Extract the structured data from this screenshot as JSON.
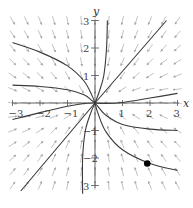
{
  "figure": {
    "type": "phase-portrait"
  },
  "axes": {
    "x_label": "x",
    "y_label": "y",
    "x_range": [
      -3,
      3
    ],
    "y_range": [
      -3,
      3
    ],
    "x_ticks": [
      {
        "value": -3,
        "label": "−3"
      },
      {
        "value": -2,
        "label": "−2"
      },
      {
        "value": -1,
        "label": "−1"
      },
      {
        "value": 1,
        "label": "1"
      },
      {
        "value": 2,
        "label": "2"
      },
      {
        "value": 3,
        "label": "3"
      }
    ],
    "y_ticks": [
      {
        "value": 3,
        "label": "3"
      },
      {
        "value": 2,
        "label": "2"
      },
      {
        "value": 1,
        "label": "1"
      },
      {
        "value": -1,
        "label": "−1"
      },
      {
        "value": -2,
        "label": "−2"
      },
      {
        "value": -3,
        "label": "3"
      }
    ]
  },
  "vector_field": {
    "grid_min": -3,
    "grid_max": 3,
    "grid_step": 0.5,
    "arrow_color": "#a8a8a8"
  },
  "solution_curves": {
    "color": "#3a3a3a",
    "curves": [
      {
        "name": "upper-left-high",
        "points": [
          [
            -3,
            2.2
          ],
          [
            -2,
            1.85
          ],
          [
            -1,
            1.35
          ],
          [
            -0.4,
            0.8
          ],
          [
            -0.1,
            0.25
          ],
          [
            0,
            0
          ]
        ]
      },
      {
        "name": "upper-left-low",
        "points": [
          [
            -3,
            0.65
          ],
          [
            -2,
            0.6
          ],
          [
            -1,
            0.48
          ],
          [
            -0.4,
            0.3
          ],
          [
            -0.1,
            0.08
          ],
          [
            0,
            0
          ]
        ]
      },
      {
        "name": "top",
        "points": [
          [
            0.45,
            3
          ],
          [
            0.42,
            2
          ],
          [
            0.32,
            1
          ],
          [
            0.15,
            0.4
          ],
          [
            0,
            0
          ]
        ]
      },
      {
        "name": "upper-right-line",
        "points": [
          [
            2.6,
            3
          ],
          [
            0,
            0
          ]
        ]
      },
      {
        "name": "right-upper",
        "points": [
          [
            3,
            0.35
          ],
          [
            2,
            0.18
          ],
          [
            1,
            0.02
          ],
          [
            0.4,
            -0.02
          ],
          [
            0,
            0
          ]
        ]
      },
      {
        "name": "left-lower",
        "points": [
          [
            -3,
            -0.6
          ],
          [
            -2,
            -0.35
          ],
          [
            -1,
            -0.12
          ],
          [
            -0.4,
            -0.02
          ],
          [
            0,
            0
          ]
        ]
      },
      {
        "name": "lower-left-line",
        "points": [
          [
            -2.7,
            -3.2
          ],
          [
            0,
            0
          ]
        ]
      },
      {
        "name": "bottom",
        "points": [
          [
            -0.45,
            -3.3
          ],
          [
            -0.45,
            -2
          ],
          [
            -0.35,
            -1
          ],
          [
            -0.15,
            -0.35
          ],
          [
            0,
            0
          ]
        ]
      },
      {
        "name": "right-lower",
        "points": [
          [
            3,
            -1.0
          ],
          [
            2,
            -0.95
          ],
          [
            1,
            -0.78
          ],
          [
            0.4,
            -0.45
          ],
          [
            0.1,
            -0.12
          ],
          [
            0,
            0
          ]
        ]
      },
      {
        "name": "through-point",
        "points": [
          [
            3,
            -2.45
          ],
          [
            2,
            -2.2
          ],
          [
            1,
            -1.7
          ],
          [
            0.4,
            -1.05
          ],
          [
            0.1,
            -0.35
          ],
          [
            0,
            0
          ]
        ]
      }
    ]
  },
  "marked_point": {
    "x": 1.9,
    "y": -2.2,
    "color": "#000000"
  },
  "chart_data": {
    "type": "scatter",
    "title": "",
    "xlabel": "x",
    "ylabel": "y",
    "xlim": [
      -3,
      3
    ],
    "ylim": [
      -3,
      3
    ],
    "grid": false,
    "series": [
      {
        "name": "marked initial point",
        "x": [
          1.9
        ],
        "y": [
          -2.2
        ]
      }
    ],
    "annotations": [
      "Direction field with arrows pointing toward origin",
      "Solution trajectories converge to (0,0)"
    ]
  }
}
